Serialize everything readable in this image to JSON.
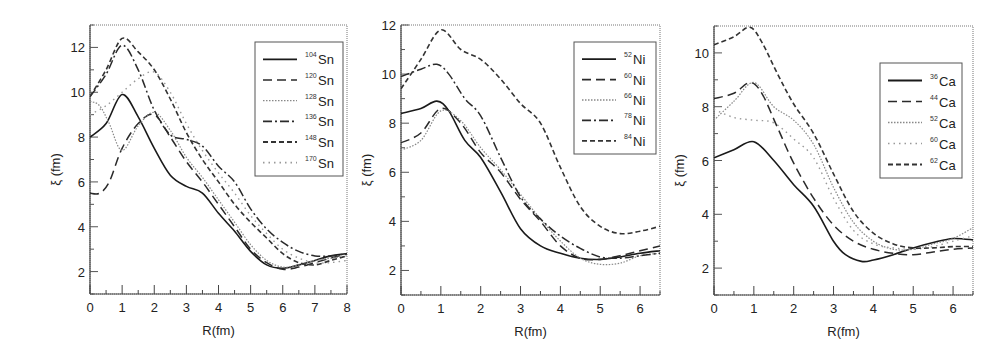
{
  "chart_data": [
    {
      "type": "line",
      "panel": "Sn",
      "title": "",
      "xlabel": "R(fm)",
      "ylabel": "ξ (fm)",
      "xlim": [
        0,
        8
      ],
      "ylim": [
        1,
        13
      ],
      "xticks": [
        0,
        1,
        2,
        3,
        4,
        5,
        6,
        7,
        8
      ],
      "yticks": [
        2,
        4,
        6,
        8,
        10,
        12
      ],
      "grid": false,
      "legend_position": "upper right",
      "series": [
        {
          "name": "104Sn",
          "mass": "104",
          "element": "Sn",
          "style": "solid",
          "color": "#1a1a1a",
          "x": [
            0,
            0.5,
            1.0,
            1.5,
            2.0,
            2.5,
            3.0,
            3.5,
            4.0,
            4.5,
            5.0,
            5.5,
            6.0,
            6.5,
            7.0,
            7.5,
            8.0
          ],
          "y": [
            8.0,
            8.6,
            9.9,
            8.9,
            7.5,
            6.3,
            5.8,
            5.5,
            4.6,
            3.8,
            2.9,
            2.3,
            2.15,
            2.3,
            2.5,
            2.7,
            2.8
          ]
        },
        {
          "name": "120Sn",
          "mass": "120",
          "element": "Sn",
          "style": "dashed",
          "color": "#2a2a2a",
          "x": [
            0,
            0.3,
            0.6,
            1.0,
            1.5,
            2.0,
            2.5,
            3.0,
            3.5,
            4.0,
            4.5,
            5.0,
            5.5,
            6.0,
            6.5,
            7.0,
            7.5,
            8.0
          ],
          "y": [
            5.5,
            5.5,
            6.0,
            7.5,
            8.6,
            9.0,
            8.0,
            6.9,
            6.0,
            5.0,
            4.0,
            3.0,
            2.4,
            2.1,
            2.2,
            2.4,
            2.6,
            2.8
          ]
        },
        {
          "name": "128Sn",
          "mass": "128",
          "element": "Sn",
          "style": "dotted-fine",
          "color": "#888888",
          "x": [
            0,
            0.3,
            0.6,
            1.0,
            1.5,
            2.0,
            2.5,
            3.0,
            3.5,
            4.0,
            4.5,
            5.0,
            5.5,
            6.0,
            6.5,
            7.0,
            7.5,
            8.0
          ],
          "y": [
            9.6,
            9.4,
            8.6,
            7.4,
            8.5,
            9.1,
            8.3,
            7.1,
            6.2,
            5.2,
            4.2,
            3.2,
            2.5,
            2.2,
            2.3,
            2.5,
            2.6,
            2.7
          ]
        },
        {
          "name": "136Sn",
          "mass": "136",
          "element": "Sn",
          "style": "dash-dot",
          "color": "#2a2a2a",
          "x": [
            0,
            0.5,
            1.0,
            1.5,
            2.0,
            2.5,
            3.0,
            3.5,
            4.0,
            4.5,
            5.0,
            5.5,
            6.0,
            6.5,
            7.0,
            7.5,
            8.0
          ],
          "y": [
            9.8,
            10.8,
            12.1,
            11.0,
            9.2,
            8.1,
            7.9,
            7.6,
            6.7,
            6.0,
            4.8,
            3.9,
            3.3,
            2.9,
            2.7,
            2.7,
            2.8
          ]
        },
        {
          "name": "148Sn",
          "mass": "148",
          "element": "Sn",
          "style": "short-dashed",
          "color": "#333333",
          "x": [
            0,
            0.5,
            1.0,
            1.5,
            2.0,
            2.5,
            3.0,
            3.5,
            4.0,
            4.5,
            5.0,
            5.5,
            6.0,
            6.5,
            7.0,
            7.5,
            8.0
          ],
          "y": [
            9.8,
            11.0,
            12.4,
            11.8,
            11.0,
            9.7,
            8.2,
            7.0,
            6.0,
            5.0,
            4.2,
            3.5,
            2.8,
            2.4,
            2.3,
            2.5,
            2.7
          ]
        },
        {
          "name": "170Sn",
          "mass": "170",
          "element": "Sn",
          "style": "sparse-dotted",
          "color": "#999999",
          "x": [
            0,
            0.5,
            1.0,
            1.5,
            2.0,
            2.5,
            3.0,
            3.5,
            4.0,
            4.5,
            5.0,
            5.5,
            6.0,
            6.5,
            7.0,
            7.5,
            8.0
          ],
          "y": [
            9.0,
            9.4,
            10.0,
            10.6,
            10.9,
            10.0,
            8.6,
            7.4,
            6.4,
            5.5,
            4.5,
            3.7,
            3.0,
            2.6,
            2.4,
            2.4,
            2.5
          ]
        }
      ]
    },
    {
      "type": "line",
      "panel": "Ni",
      "title": "",
      "xlabel": "R(fm)",
      "ylabel": "ξ (fm)",
      "xlim": [
        0,
        6.5
      ],
      "ylim": [
        1,
        12
      ],
      "xticks": [
        0,
        1,
        2,
        3,
        4,
        5,
        6
      ],
      "yticks": [
        2,
        4,
        6,
        8,
        10,
        12
      ],
      "grid": false,
      "legend_position": "upper right",
      "series": [
        {
          "name": "52Ni",
          "mass": "52",
          "element": "Ni",
          "style": "solid",
          "color": "#1a1a1a",
          "x": [
            0,
            0.5,
            0.9,
            1.2,
            1.6,
            2.0,
            2.5,
            3.0,
            3.5,
            4.0,
            4.5,
            5.0,
            5.5,
            6.0,
            6.5
          ],
          "y": [
            8.4,
            8.6,
            8.9,
            8.5,
            7.3,
            6.6,
            5.2,
            3.7,
            3.0,
            2.7,
            2.5,
            2.45,
            2.55,
            2.7,
            2.8
          ]
        },
        {
          "name": "60Ni",
          "mass": "60",
          "element": "Ni",
          "style": "dashed",
          "color": "#2a2a2a",
          "x": [
            0,
            0.5,
            1.0,
            1.5,
            2.0,
            2.5,
            3.0,
            3.5,
            4.0,
            4.5,
            5.0,
            5.5,
            6.0,
            6.5
          ],
          "y": [
            7.2,
            7.6,
            8.6,
            8.0,
            6.8,
            6.0,
            4.9,
            4.0,
            3.0,
            2.5,
            2.45,
            2.6,
            2.8,
            3.0
          ]
        },
        {
          "name": "66Ni",
          "mass": "66",
          "element": "Ni",
          "style": "dotted-fine",
          "color": "#888888",
          "x": [
            0,
            0.5,
            1.0,
            1.5,
            2.0,
            2.5,
            3.0,
            3.5,
            4.0,
            4.5,
            5.0,
            5.5,
            6.0,
            6.5
          ],
          "y": [
            6.9,
            7.3,
            8.5,
            8.1,
            7.0,
            6.1,
            5.1,
            4.1,
            3.2,
            2.5,
            2.25,
            2.3,
            2.6,
            2.7
          ]
        },
        {
          "name": "78Ni",
          "mass": "78",
          "element": "Ni",
          "style": "dash-dot",
          "color": "#2a2a2a",
          "x": [
            0,
            0.5,
            0.9,
            1.2,
            1.6,
            2.0,
            2.5,
            3.0,
            3.5,
            4.0,
            4.5,
            5.0,
            5.5,
            6.0,
            6.5
          ],
          "y": [
            9.9,
            10.2,
            10.4,
            10.0,
            9.0,
            8.3,
            6.6,
            5.0,
            4.1,
            3.4,
            2.9,
            2.55,
            2.5,
            2.6,
            2.7
          ]
        },
        {
          "name": "84Ni",
          "mass": "84",
          "element": "Ni",
          "style": "short-dashed",
          "color": "#333333",
          "x": [
            0,
            0.5,
            1.0,
            1.5,
            2.0,
            2.5,
            3.0,
            3.5,
            4.0,
            4.5,
            5.0,
            5.5,
            6.0,
            6.5
          ],
          "y": [
            9.4,
            10.6,
            11.8,
            11.0,
            10.6,
            9.8,
            8.8,
            8.0,
            6.2,
            4.6,
            3.8,
            3.5,
            3.6,
            3.8
          ]
        }
      ]
    },
    {
      "type": "line",
      "panel": "Ca",
      "title": "",
      "xlabel": "R(fm)",
      "ylabel": "ξ (fm)",
      "xlim": [
        0,
        6.5
      ],
      "ylim": [
        1,
        11
      ],
      "xticks": [
        0,
        1,
        2,
        3,
        4,
        5,
        6
      ],
      "yticks": [
        2,
        4,
        6,
        8,
        10
      ],
      "grid": false,
      "legend_position": "upper right",
      "series": [
        {
          "name": "36Ca",
          "mass": "36",
          "element": "Ca",
          "style": "solid",
          "color": "#1a1a1a",
          "x": [
            0,
            0.5,
            1.0,
            1.5,
            2.0,
            2.5,
            3.0,
            3.3,
            3.7,
            4.0,
            4.5,
            5.0,
            5.5,
            6.0,
            6.5
          ],
          "y": [
            6.1,
            6.4,
            6.7,
            6.0,
            5.1,
            4.3,
            3.0,
            2.5,
            2.25,
            2.3,
            2.5,
            2.75,
            2.95,
            3.1,
            3.05
          ]
        },
        {
          "name": "44Ca",
          "mass": "44",
          "element": "Ca",
          "style": "dashed",
          "color": "#2a2a2a",
          "x": [
            0,
            0.5,
            0.9,
            1.2,
            1.6,
            2.0,
            2.5,
            3.0,
            3.5,
            4.0,
            4.5,
            5.0,
            5.5,
            6.0,
            6.5
          ],
          "y": [
            8.3,
            8.5,
            8.9,
            8.5,
            7.2,
            5.9,
            4.6,
            3.6,
            3.0,
            2.7,
            2.55,
            2.5,
            2.6,
            2.7,
            2.75
          ]
        },
        {
          "name": "52Ca",
          "mass": "52",
          "element": "Ca",
          "style": "dotted-fine",
          "color": "#888888",
          "x": [
            0,
            0.5,
            1.0,
            1.5,
            2.0,
            2.5,
            3.0,
            3.5,
            4.0,
            4.5,
            5.0,
            5.5,
            6.0,
            6.5
          ],
          "y": [
            7.5,
            8.2,
            8.9,
            8.0,
            7.5,
            6.6,
            5.0,
            3.7,
            3.0,
            2.7,
            2.7,
            2.9,
            3.1,
            3.5
          ]
        },
        {
          "name": "60Ca",
          "mass": "60",
          "element": "Ca",
          "style": "sparse-dotted",
          "color": "#999999",
          "x": [
            0,
            0.5,
            1.0,
            1.5,
            2.0,
            2.5,
            3.0,
            3.5,
            4.0,
            4.5,
            5.0,
            5.5,
            6.0,
            6.5
          ],
          "y": [
            7.9,
            7.6,
            7.5,
            7.4,
            6.8,
            6.1,
            4.6,
            3.4,
            2.9,
            2.75,
            2.7,
            2.8,
            3.0,
            3.2
          ]
        },
        {
          "name": "62Ca",
          "mass": "62",
          "element": "Ca",
          "style": "short-dashed",
          "color": "#333333",
          "x": [
            0,
            0.5,
            0.9,
            1.2,
            1.6,
            2.0,
            2.5,
            3.0,
            3.5,
            4.0,
            4.5,
            5.0,
            5.5,
            6.0,
            6.5
          ],
          "y": [
            10.3,
            10.6,
            10.95,
            10.4,
            9.2,
            8.1,
            7.0,
            5.5,
            4.1,
            3.3,
            2.9,
            2.75,
            2.75,
            2.8,
            2.8
          ]
        }
      ]
    }
  ],
  "panels": [
    {
      "id": "sn",
      "legend_title": "",
      "xlabel": "R(fm)",
      "ylabel": "ξ (fm)"
    },
    {
      "id": "ni",
      "legend_title": "",
      "xlabel": "R(fm)",
      "ylabel": "ξ (fm)"
    },
    {
      "id": "ca",
      "legend_title": "",
      "xlabel": "R(fm)",
      "ylabel": "ξ (fm)"
    }
  ]
}
